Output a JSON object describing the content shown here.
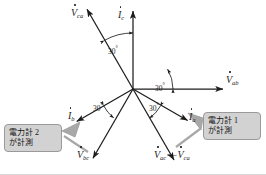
{
  "diagram": {
    "origin": {
      "x": 133,
      "y": 89
    },
    "colors": {
      "stroke": "#1d1d1d",
      "callout_fill": "#d2d2d2",
      "callout_border": "#9a9a9a",
      "tail_fill": "#a8a8a8",
      "background": "#ffffff"
    }
  },
  "vectors": [
    {
      "id": "V_ca",
      "symbol": "V",
      "sub": "ca",
      "dot": true,
      "label": "V̇ca",
      "label_x": 71,
      "label_y": 8,
      "angle_deg": 120,
      "length": 92,
      "kind": "voltage"
    },
    {
      "id": "I_c",
      "symbol": "I",
      "sub": "c",
      "dot": true,
      "label": "İc",
      "label_x": 118,
      "label_y": 10,
      "angle_deg": 90,
      "length": 78,
      "kind": "current"
    },
    {
      "id": "V_ab",
      "symbol": "V",
      "sub": "ab",
      "dot": true,
      "label": "V̇ab",
      "label_x": 222,
      "label_y": 74,
      "angle_deg": 0,
      "length": 90,
      "kind": "voltage"
    },
    {
      "id": "I_a",
      "symbol": "I",
      "sub": "a",
      "dot": true,
      "label": "İa",
      "label_x": 188,
      "label_y": 113,
      "angle_deg": -30,
      "length": 63,
      "kind": "current"
    },
    {
      "id": "V_ac",
      "symbol": "V",
      "sub": "ac",
      "dot": true,
      "label": "V̇ac",
      "label_x": 155,
      "label_y": 150,
      "angle_deg": -60,
      "length": 82,
      "kind": "voltage"
    },
    {
      "id": "V_bc",
      "symbol": "V",
      "sub": "bc",
      "dot": true,
      "label": "V̇bc",
      "label_x": 78,
      "label_y": 148,
      "angle_deg": -120,
      "length": 80,
      "kind": "voltage"
    },
    {
      "id": "I_b",
      "symbol": "I",
      "sub": "b",
      "dot": true,
      "label": "İb",
      "label_x": 69,
      "label_y": 112,
      "angle_deg": -150,
      "length": 65,
      "kind": "current"
    }
  ],
  "vector_labels": {
    "v_ca": {
      "letter": "V",
      "sub": "ca"
    },
    "i_c": {
      "letter": "I",
      "sub": "c"
    },
    "v_ab": {
      "letter": "V",
      "sub": "ab"
    },
    "i_a": {
      "letter": "I",
      "sub": "a"
    },
    "v_bc": {
      "letter": "V",
      "sub": "bc"
    },
    "i_b": {
      "letter": "I",
      "sub": "b"
    },
    "v_ac_equation": {
      "lhs_letter": "V",
      "lhs_sub": "ac",
      "equals": "=−",
      "rhs_letter": "V",
      "rhs_sub": "ca"
    }
  },
  "angles": [
    {
      "id": "angle-vca-ic",
      "text": "30",
      "degree_symbol": "°",
      "x": 108,
      "y": 45
    },
    {
      "id": "angle-vab-ia",
      "text": "30",
      "degree_symbol": "°",
      "x": 152,
      "y": 88
    },
    {
      "id": "angle-ia-vac",
      "text": "30",
      "degree_symbol": "°",
      "x": 148,
      "y": 105
    },
    {
      "id": "angle-ib-vbc",
      "text": "30",
      "degree_symbol": "°",
      "x": 94,
      "y": 105
    }
  ],
  "callouts": [
    {
      "id": "callout-left",
      "line1_prefix": "電力計",
      "line1_number": " 2",
      "line2": "が計測",
      "points_to": "I_b"
    },
    {
      "id": "callout-right",
      "line1_prefix": "電力計",
      "line1_number": " 1",
      "line2": "が計測",
      "points_to": "I_a"
    }
  ]
}
